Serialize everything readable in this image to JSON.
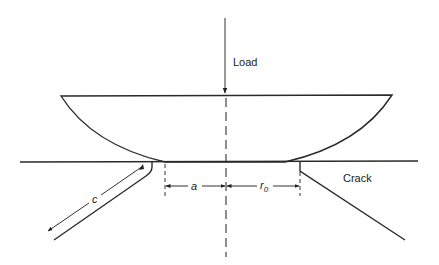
{
  "diagram": {
    "type": "indentation-crack-schematic",
    "labels": {
      "load": "Load",
      "crack": "Crack",
      "a": "a",
      "r0_main": "r",
      "r0_sub": "0",
      "c": "c"
    },
    "colors": {
      "line": "#2a2a2a",
      "background": "#ffffff"
    },
    "elements": [
      {
        "id": "load-arrow",
        "description": "Vertical downward arrow indicating applied load"
      },
      {
        "id": "indenter",
        "description": "Spherical-cap indenter pressed onto surface"
      },
      {
        "id": "specimen-surface",
        "description": "Horizontal surface line of specimen"
      },
      {
        "id": "centerline",
        "description": "Dashed vertical axis of symmetry"
      },
      {
        "id": "contact-radius-a",
        "description": "Dimension a: contact radius"
      },
      {
        "id": "flaw-radius-r0",
        "description": "Dimension r0: radius to ring crack origin"
      },
      {
        "id": "cone-crack-left",
        "description": "Left cone crack with length c"
      },
      {
        "id": "cone-crack-right",
        "description": "Right cone crack labeled Crack"
      }
    ]
  }
}
